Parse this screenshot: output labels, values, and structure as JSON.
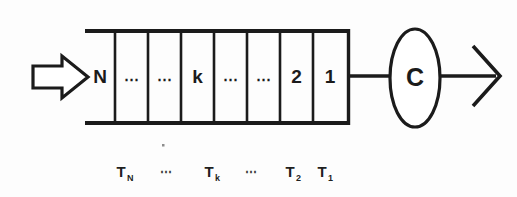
{
  "diagram": {
    "type": "queueing-system-schematic",
    "background_color": "#fdfdfd",
    "ink_color": "#1b1b1b",
    "input_arrow": {
      "name": "arrival-arrow",
      "style": "hollow-block-arrow",
      "direction": "right",
      "label": ""
    },
    "queue": {
      "name": "waiting-line",
      "open_side": "left",
      "cells": [
        {
          "label": "N",
          "kind": "position"
        },
        {
          "label": "⋯",
          "kind": "ellipsis"
        },
        {
          "label": "⋯",
          "kind": "ellipsis"
        },
        {
          "label": "k",
          "kind": "position"
        },
        {
          "label": "⋯",
          "kind": "ellipsis"
        },
        {
          "label": "⋯",
          "kind": "ellipsis"
        },
        {
          "label": "2",
          "kind": "position"
        },
        {
          "label": "1",
          "kind": "position"
        }
      ]
    },
    "connector": {
      "name": "queue-to-server-link",
      "style": "solid-line"
    },
    "server": {
      "name": "service-node",
      "shape": "ellipse",
      "label": "C"
    },
    "output_arrow": {
      "name": "departure-arrow",
      "style": "open-line-arrow",
      "direction": "right",
      "label": ""
    },
    "service_time_labels": [
      {
        "base": "T",
        "sub": "N"
      },
      {
        "base": "⋯",
        "sub": ""
      },
      {
        "base": "T",
        "sub": "k"
      },
      {
        "base": "⋯",
        "sub": ""
      },
      {
        "base": "T",
        "sub": "2"
      },
      {
        "base": "T",
        "sub": "1"
      }
    ]
  }
}
